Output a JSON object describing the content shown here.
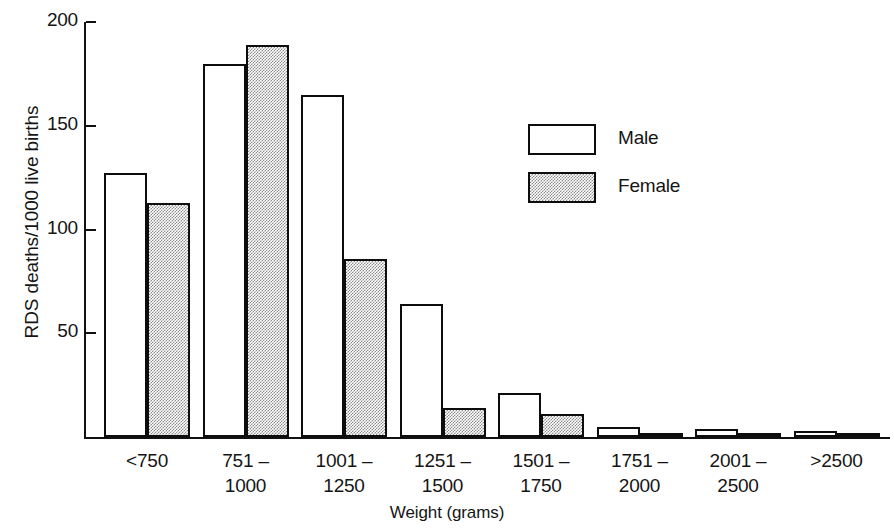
{
  "chart_data": {
    "type": "bar",
    "title": "",
    "xlabel": "Weight (grams)",
    "ylabel": "RDS deaths/1000 live births",
    "categories": [
      "<750",
      "751 – 1000",
      "1001 – 1250",
      "1251 – 1500",
      "1501 – 1750",
      "1751 – 2000",
      "2001 – 2500",
      ">2500"
    ],
    "category_lines": [
      {
        "line1": "<750",
        "line2": ""
      },
      {
        "line1": "751 –",
        "line2": "1000"
      },
      {
        "line1": "1001 –",
        "line2": "1250"
      },
      {
        "line1": "1251 –",
        "line2": "1500"
      },
      {
        "line1": "1501 –",
        "line2": "1750"
      },
      {
        "line1": "1751 –",
        "line2": "2000"
      },
      {
        "line1": "2001 –",
        "line2": "2500"
      },
      {
        "line1": ">2500",
        "line2": ""
      }
    ],
    "series": [
      {
        "name": "Male",
        "values": [
          127,
          180,
          165,
          64,
          21,
          5,
          4,
          3
        ],
        "fill": "white"
      },
      {
        "name": "Female",
        "values": [
          113,
          189,
          86,
          14,
          11,
          2,
          2,
          1
        ],
        "fill": "stipple"
      }
    ],
    "ylim": [
      0,
      200
    ],
    "yticks": [
      50,
      100,
      150,
      200
    ],
    "ytick_labels": [
      "50",
      "100",
      "150",
      "200"
    ],
    "grid": false,
    "legend_position": "inside-upper-right",
    "legend": [
      {
        "label": "Male",
        "swatch": "white"
      },
      {
        "label": "Female",
        "swatch": "stipple"
      }
    ]
  },
  "colors": {
    "line": "#0d0d0d",
    "text": "#151515",
    "background": "#ffffff",
    "stipple_gray": "#8d8d8d"
  }
}
